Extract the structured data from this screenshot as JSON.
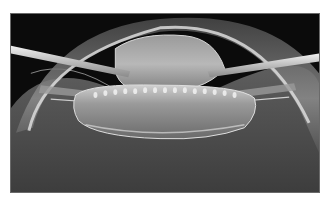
{
  "image": {
    "subject": "grayscale photograph of lens structure between two instrument probes",
    "palette": {
      "background": "#0b0b0b",
      "frame": "#6a6a6a",
      "page": "#ffffff",
      "highlight": "#e8e8e8",
      "midtone": "#7a7a7a",
      "shadow": "#2a2a2a"
    }
  }
}
